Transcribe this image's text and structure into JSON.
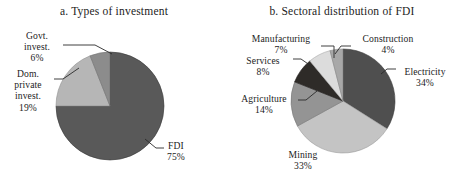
{
  "figure": {
    "background_color": "#ffffff",
    "text_color": "#1c1c1c"
  },
  "chart_data": [
    {
      "type": "pie",
      "id": "panel-a",
      "title": "a. Types of investment",
      "categories": [
        "FDI",
        "Dom. private invest.",
        "Govt. invest."
      ],
      "values": [
        75,
        19,
        6
      ],
      "unit": "%",
      "labels": [
        "FDI 75%",
        "Dom. private invest. 19%",
        "Govt. invest. 6%"
      ],
      "colors": [
        "#595959",
        "#b6b6b6",
        "#8c8c8c"
      ],
      "start_angle_deg": 0,
      "direction": "clockwise",
      "legend": "none",
      "grid": false,
      "slices": [
        {
          "name": "FDI",
          "value": 75,
          "value_text": "75%",
          "color": "#595959",
          "label_line1": "FDI",
          "label_line2": "75%"
        },
        {
          "name": "Dom. private invest.",
          "value": 19,
          "value_text": "19%",
          "color": "#b6b6b6",
          "label_line1": "Dom.",
          "label_line2": "private",
          "label_line3": "invest.",
          "label_line4": "19%"
        },
        {
          "name": "Govt. invest.",
          "value": 6,
          "value_text": "6%",
          "color": "#8c8c8c",
          "label_line1": "Govt.",
          "label_line2": "invest.",
          "label_line3": "6%"
        }
      ]
    },
    {
      "type": "pie",
      "id": "panel-b",
      "title": "b. Sectoral distribution of FDI",
      "categories": [
        "Electricity",
        "Mining",
        "Agriculture",
        "Services",
        "Manufacturing",
        "Construction"
      ],
      "values": [
        34,
        33,
        14,
        8,
        7,
        4
      ],
      "unit": "%",
      "labels": [
        "Electricity 34%",
        "Mining 33%",
        "Agriculture 14%",
        "Services 8%",
        "Manufacturing 7%",
        "Construction 4%"
      ],
      "colors": [
        "#4f4f4f",
        "#c4c4c4",
        "#949494",
        "#2e2b28",
        "#dcdcdc",
        "#a8a8a8"
      ],
      "start_angle_deg": 0,
      "direction": "clockwise",
      "legend": "none",
      "grid": false,
      "slices": [
        {
          "name": "Electricity",
          "value": 34,
          "value_text": "34%",
          "color": "#4f4f4f",
          "label_line1": "Electricity",
          "label_line2": "34%"
        },
        {
          "name": "Mining",
          "value": 33,
          "value_text": "33%",
          "color": "#c4c4c4",
          "label_line1": "Mining",
          "label_line2": "33%"
        },
        {
          "name": "Agriculture",
          "value": 14,
          "value_text": "14%",
          "color": "#949494",
          "label_line1": "Agriculture",
          "label_line2": "14%"
        },
        {
          "name": "Services",
          "value": 8,
          "value_text": "8%",
          "color": "#2e2b28",
          "label_line1": "Services",
          "label_line2": "8%"
        },
        {
          "name": "Manufacturing",
          "value": 7,
          "value_text": "7%",
          "color": "#dcdcdc",
          "label_line1": "Manufacturing",
          "label_line2": "7%"
        },
        {
          "name": "Construction",
          "value": 4,
          "value_text": "4%",
          "color": "#a8a8a8",
          "label_line1": "Construction",
          "label_line2": "4%"
        }
      ]
    }
  ],
  "panel_a": {
    "title": "a. Types of investment",
    "label_fdi": {
      "name": "FDI",
      "pct": "75%"
    },
    "label_dom": {
      "l1": "Dom.",
      "l2": "private",
      "l3": "invest.",
      "pct": "19%"
    },
    "label_govt": {
      "l1": "Govt.",
      "l2": "invest.",
      "pct": "6%"
    }
  },
  "panel_b": {
    "title": "b. Sectoral distribution of FDI",
    "label_manufacturing": {
      "name": "Manufacturing",
      "pct": "7%"
    },
    "label_services": {
      "name": "Services",
      "pct": "8%"
    },
    "label_agriculture": {
      "name": "Agriculture",
      "pct": "14%"
    },
    "label_mining": {
      "name": "Mining",
      "pct": "33%"
    },
    "label_construction": {
      "name": "Construction",
      "pct": "4%"
    },
    "label_electricity": {
      "name": "Electricity",
      "pct": "34%"
    }
  }
}
